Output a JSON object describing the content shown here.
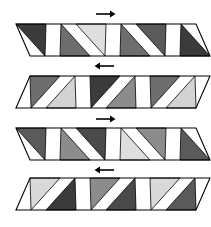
{
  "figure": {
    "title": "",
    "type": "shear-band-diagram",
    "width": 211,
    "height": 227,
    "background": "#ffffff",
    "outline_color": "#000000",
    "palette": {
      "darkest": "#3b3b3b",
      "dark": "#4a4a4a",
      "medium_dark": "#6e6e6e",
      "medium": "#808080",
      "light": "#c9c9c9",
      "lightest": "#dedede"
    },
    "bands": [
      {
        "index": 1,
        "label": "band-1",
        "arrow": {
          "direction": "right",
          "glyph": "→",
          "x_center": 105,
          "y": 14
        },
        "geometry": {
          "top_y": 24,
          "bottom_y": 56,
          "top_left_x": 16,
          "top_right_x": 196,
          "bottom_left_x": 30,
          "bottom_right_x": 210,
          "shear": "top-left-leading"
        },
        "triangles": [
          {
            "position": 1,
            "orientation": "down",
            "shade": "#3b3b3b"
          },
          {
            "position": 2,
            "orientation": "up",
            "shade": "#6e6e6e"
          },
          {
            "position": 3,
            "orientation": "down",
            "shade": "#dedede"
          },
          {
            "position": 4,
            "orientation": "up",
            "shade": "#6e6e6e"
          },
          {
            "position": 5,
            "orientation": "down",
            "shade": "#5a5a5a"
          },
          {
            "position": 6,
            "orientation": "up",
            "shade": "#3b3b3b"
          }
        ]
      },
      {
        "index": 2,
        "label": "band-2",
        "arrow": {
          "direction": "left",
          "glyph": "←",
          "x_center": 105,
          "y": 66
        },
        "geometry": {
          "top_y": 76,
          "bottom_y": 108,
          "top_left_x": 30,
          "top_right_x": 210,
          "bottom_left_x": 16,
          "bottom_right_x": 196,
          "shear": "bottom-left-leading"
        },
        "triangles": [
          {
            "position": 1,
            "orientation": "down",
            "shade": "#6e6e6e"
          },
          {
            "position": 2,
            "orientation": "up",
            "shade": "#d3d3d3"
          },
          {
            "position": 3,
            "orientation": "down",
            "shade": "#3b3b3b"
          },
          {
            "position": 4,
            "orientation": "up",
            "shade": "#8c8c8c"
          },
          {
            "position": 5,
            "orientation": "down",
            "shade": "#6e6e6e"
          },
          {
            "position": 6,
            "orientation": "up",
            "shade": "#d3d3d3"
          }
        ]
      },
      {
        "index": 3,
        "label": "band-3",
        "arrow": {
          "direction": "right",
          "glyph": "→",
          "x_center": 105,
          "y": 119
        },
        "geometry": {
          "top_y": 128,
          "bottom_y": 160,
          "top_left_x": 16,
          "top_right_x": 196,
          "bottom_left_x": 30,
          "bottom_right_x": 210,
          "shear": "top-left-leading"
        },
        "triangles": [
          {
            "position": 1,
            "orientation": "down",
            "shade": "#5a5a5a"
          },
          {
            "position": 2,
            "orientation": "up",
            "shade": "#8c8c8c"
          },
          {
            "position": 3,
            "orientation": "down",
            "shade": "#4a4a4a"
          },
          {
            "position": 4,
            "orientation": "up",
            "shade": "#dedede"
          },
          {
            "position": 5,
            "orientation": "down",
            "shade": "#8c8c8c"
          },
          {
            "position": 6,
            "orientation": "up",
            "shade": "#5a5a5a"
          }
        ]
      },
      {
        "index": 4,
        "label": "band-4",
        "arrow": {
          "direction": "left",
          "glyph": "←",
          "x_center": 105,
          "y": 170
        },
        "geometry": {
          "top_y": 178,
          "bottom_y": 210,
          "top_left_x": 30,
          "top_right_x": 210,
          "bottom_left_x": 16,
          "bottom_right_x": 196,
          "shear": "bottom-left-leading"
        },
        "triangles": [
          {
            "position": 1,
            "orientation": "down",
            "shade": "#d9d9d9"
          },
          {
            "position": 2,
            "orientation": "up",
            "shade": "#3b3b3b"
          },
          {
            "position": 3,
            "orientation": "down",
            "shade": "#8c8c8c"
          },
          {
            "position": 4,
            "orientation": "up",
            "shade": "#4a4a4a"
          },
          {
            "position": 5,
            "orientation": "down",
            "shade": "#d9d9d9"
          },
          {
            "position": 6,
            "orientation": "up",
            "shade": "#5a5a5a"
          }
        ]
      }
    ]
  }
}
